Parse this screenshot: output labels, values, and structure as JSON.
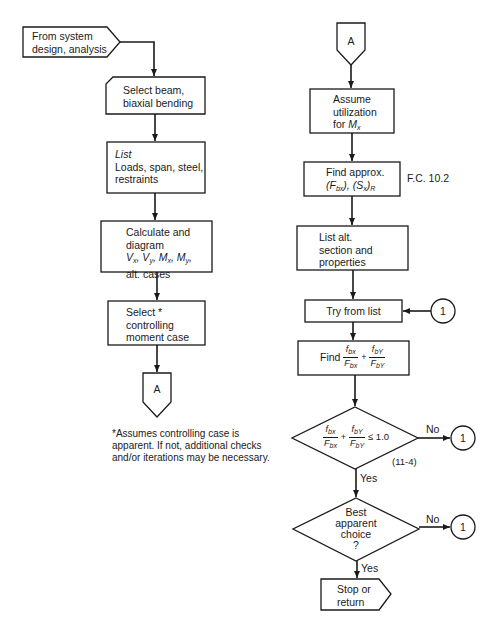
{
  "diagram": {
    "type": "flowchart",
    "colors": {
      "stroke": "#1a1a1a",
      "background": "#ffffff"
    },
    "left_column": {
      "start": {
        "line1": "From system",
        "line2": "design, analysis"
      },
      "select_beam": {
        "line1": "Select beam,",
        "line2": "biaxial bending"
      },
      "list_box": {
        "title": "List",
        "line1": "Loads, span, steel,",
        "line2": "restraints"
      },
      "calculate": {
        "line1": "Calculate and",
        "line2": "diagram",
        "vx": "V",
        "vx_sub": "x",
        "vy": "V",
        "vy_sub": "y",
        "mx": "M",
        "mx_sub": "x",
        "my": "M",
        "my_sub": "y",
        "line4": "alt. cases"
      },
      "select_case": {
        "line1": "Select *",
        "line2": "controlling",
        "line3": "moment case"
      },
      "connector_a": "A",
      "footnote": {
        "line1": "*Assumes controlling case is",
        "line2": "apparent. If not, additional checks",
        "line3": "and/or iterations may be necessary."
      }
    },
    "right_column": {
      "connector_a": "A",
      "assume": {
        "line1": "Assume",
        "line2": "utilization",
        "line3_prefix": "for ",
        "m": "M",
        "m_sub": "x"
      },
      "find_approx": {
        "line1": "Find approx.",
        "f": "F",
        "f_sub": "bx",
        "s": "S",
        "s_sub": "x",
        "s_outer_sub": "R",
        "ref": "F.C. 10.2"
      },
      "list_alt": {
        "line1": "List alt.",
        "line2": "section and",
        "line3": "properties"
      },
      "try_list": {
        "label": "Try from list",
        "connector": "1"
      },
      "find_ratio": {
        "prefix": "Find",
        "num1": "f",
        "num1_sub": "bx",
        "den1": "F",
        "den1_sub": "bx",
        "op": "+",
        "num2": "f",
        "num2_sub": "bY",
        "den2": "F",
        "den2_sub": "bY"
      },
      "decision1": {
        "num1": "f",
        "num1_sub": "bx",
        "den1": "F",
        "den1_sub": "bx",
        "op": "+",
        "num2": "f",
        "num2_sub": "bY",
        "den2": "F",
        "den2_sub": "bY",
        "rhs": "≤ 1.0",
        "eq_ref": "(11-4)",
        "no_label": "No",
        "yes_label": "Yes",
        "connector": "1"
      },
      "decision2": {
        "line1": "Best",
        "line2": "apparent",
        "line3": "choice",
        "line4": "?",
        "no_label": "No",
        "yes_label": "Yes",
        "connector": "1"
      },
      "stop": {
        "line1": "Stop or",
        "line2": "return"
      }
    }
  }
}
